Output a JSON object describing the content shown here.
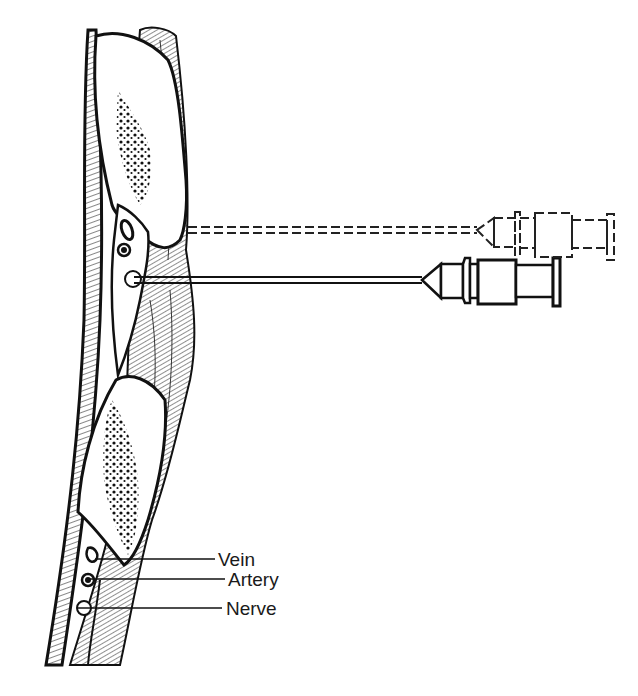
{
  "figure": {
    "labels": [
      {
        "id": "vein",
        "text": "Vein"
      },
      {
        "id": "artery",
        "text": "Artery"
      },
      {
        "id": "nerve",
        "text": "Nerve"
      }
    ],
    "colors": {
      "ink": "#111111",
      "background": "#ffffff"
    },
    "syringes": [
      {
        "style": "solid",
        "needle_y": 280
      },
      {
        "style": "dashed",
        "needle_y": 230
      }
    ]
  }
}
